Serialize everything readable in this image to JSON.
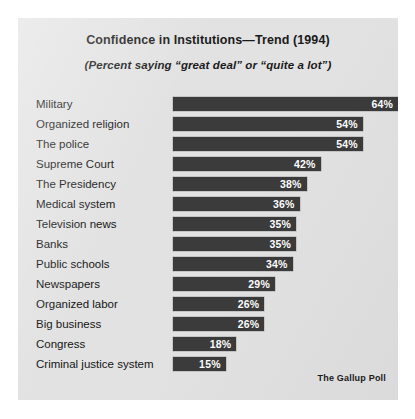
{
  "chart_data": {
    "type": "bar",
    "title": "Confidence in Institutions—Trend (1994)",
    "subtitle": "(Percent saying “great deal” or “quite a lot”)",
    "orientation": "horizontal",
    "xlabel": "",
    "ylabel": "",
    "xlim": [
      0,
      64
    ],
    "grid": false,
    "legend": null,
    "value_suffix": "%",
    "source": "The Gallup Poll",
    "categories": [
      "Military",
      "Organized religion",
      "The police",
      "Supreme Court",
      "The Presidency",
      "Medical system",
      "Television news",
      "Banks",
      "Public schools",
      "Newspapers",
      "Organized labor",
      "Big business",
      "Congress",
      "Criminal justice system"
    ],
    "values": [
      64,
      54,
      54,
      42,
      38,
      36,
      35,
      35,
      34,
      29,
      26,
      26,
      18,
      15
    ],
    "value_labels": [
      "64%",
      "54%",
      "54%",
      "42%",
      "38%",
      "36%",
      "35%",
      "35%",
      "34%",
      "29%",
      "26%",
      "26%",
      "18%",
      "15%"
    ],
    "colors": {
      "bar": "#3b3b3b",
      "panel_background": "#e2e2e2",
      "page_background": "#ffffff",
      "label_text": "#141414",
      "value_text": "#ffffff"
    }
  }
}
